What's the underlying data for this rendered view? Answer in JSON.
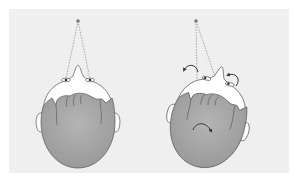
{
  "figure": {
    "background_color": "#efefef",
    "panels": [
      {
        "name": "head-neutral",
        "fixation_point": {
          "x": 78,
          "y": 21
        },
        "eyes": [
          {
            "x": 66,
            "y": 80
          },
          {
            "x": 90,
            "y": 80
          }
        ],
        "arrows": 0
      },
      {
        "name": "head-rotated",
        "fixation_point": {
          "x": 196,
          "y": 21
        },
        "eyes": [
          {
            "x": 197,
            "y": 81
          },
          {
            "x": 218,
            "y": 86
          }
        ],
        "arrows": 3
      }
    ],
    "colors": {
      "hair": "#a8a8a8",
      "skin": "#ffffff",
      "outline": "#555555",
      "dashed_line": "#888888",
      "fixation_point": "#7a7a7a",
      "arrow": "#333333"
    }
  }
}
